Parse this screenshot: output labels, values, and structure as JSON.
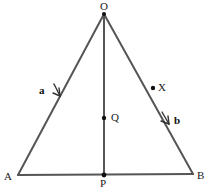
{
  "figure": {
    "type": "geometry-diagram",
    "background_color": "#ffffff",
    "stroke_color": "#555555",
    "stroke_width": 2,
    "marker_color": "#111111",
    "label_color": "#1a1a1a",
    "width": 208,
    "height": 190
  },
  "vertices": {
    "O": {
      "label": "O",
      "x": 104,
      "y": 14,
      "label_x": 100,
      "label_y": 1
    },
    "A": {
      "label": "A",
      "x": 18,
      "y": 175,
      "label_x": 4,
      "label_y": 171
    },
    "B": {
      "label": "B",
      "x": 193,
      "y": 174,
      "label_x": 197,
      "label_y": 170
    }
  },
  "points": {
    "P": {
      "label": "P",
      "x": 104,
      "y": 175,
      "label_x": 100,
      "label_y": 178
    },
    "Q": {
      "label": "Q",
      "x": 104,
      "y": 118,
      "label_x": 111,
      "label_y": 112
    },
    "X": {
      "label": "X",
      "x": 153,
      "y": 88,
      "label_x": 158,
      "label_y": 82
    }
  },
  "segments": [
    {
      "name": "OA",
      "from": "O",
      "to": "A"
    },
    {
      "name": "OB",
      "from": "O",
      "to": "B"
    },
    {
      "name": "AB",
      "from": "A",
      "to": "B"
    },
    {
      "name": "OP",
      "from": "O",
      "to": "P"
    }
  ],
  "vectors": [
    {
      "name": "a",
      "label": "a",
      "on_segment": "OA",
      "label_x": 39,
      "label_y": 85,
      "arrow_x": 59,
      "arrow_y": 95
    },
    {
      "name": "b",
      "label": "b",
      "on_segment": "OB",
      "label_x": 174,
      "label_y": 115,
      "arrow_x": 168,
      "arrow_y": 123
    }
  ]
}
